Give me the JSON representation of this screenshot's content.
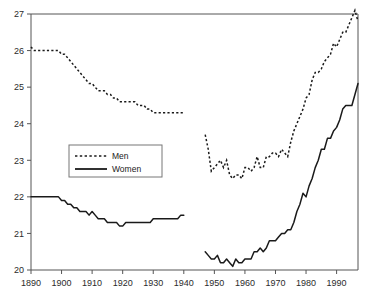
{
  "chart_data": {
    "type": "line",
    "title": "",
    "xlabel": "",
    "ylabel": "",
    "xlim": [
      1890,
      1997
    ],
    "ylim": [
      20,
      27
    ],
    "grid": false,
    "legend_position": "upper-left-inside",
    "xticks": [
      1890,
      1900,
      1910,
      1920,
      1930,
      1940,
      1950,
      1960,
      1970,
      1980,
      1990
    ],
    "yticks": [
      20,
      21,
      22,
      23,
      24,
      25,
      26,
      27
    ],
    "xtick_labels": [
      "1890",
      "1900",
      "1910",
      "1920",
      "1930",
      "1940",
      "1950",
      "1960",
      "1970",
      "1980",
      "1990"
    ],
    "ytick_labels": [
      "20",
      "21",
      "22",
      "23",
      "24",
      "25",
      "26",
      "27"
    ],
    "series": [
      {
        "name": "Men",
        "style": "dashed",
        "color": "#1a1a1a",
        "segments": [
          {
            "x": [
              1890,
              1891,
              1892,
              1893,
              1894,
              1895,
              1896,
              1897,
              1898,
              1899,
              1900,
              1901,
              1902,
              1903,
              1904,
              1905,
              1906,
              1907,
              1908,
              1909,
              1910,
              1911,
              1912,
              1913,
              1914,
              1915,
              1916,
              1917,
              1918,
              1919,
              1920,
              1921,
              1922,
              1923,
              1924,
              1925,
              1926,
              1927,
              1928,
              1929,
              1930,
              1931,
              1932,
              1933,
              1934,
              1935,
              1936,
              1937,
              1938,
              1939,
              1940
            ],
            "y": [
              26.1,
              26.0,
              26.0,
              26.0,
              26.0,
              26.0,
              26.0,
              26.0,
              26.0,
              26.0,
              25.9,
              25.9,
              25.8,
              25.7,
              25.6,
              25.5,
              25.4,
              25.3,
              25.2,
              25.1,
              25.1,
              25.0,
              24.9,
              24.9,
              24.9,
              24.8,
              24.8,
              24.7,
              24.7,
              24.6,
              24.6,
              24.6,
              24.6,
              24.6,
              24.6,
              24.5,
              24.5,
              24.5,
              24.4,
              24.4,
              24.3,
              24.3,
              24.3,
              24.3,
              24.3,
              24.3,
              24.3,
              24.3,
              24.3,
              24.3,
              24.3
            ]
          },
          {
            "x": [
              1947,
              1948,
              1949,
              1950,
              1951,
              1952,
              1953,
              1954,
              1955,
              1956,
              1957,
              1958,
              1959,
              1960,
              1961,
              1962,
              1963,
              1964,
              1965,
              1966,
              1967,
              1968,
              1969,
              1970,
              1971,
              1972,
              1973,
              1974,
              1975,
              1976,
              1977,
              1978,
              1979,
              1980,
              1981,
              1982,
              1983,
              1984,
              1985,
              1986,
              1987,
              1988,
              1989,
              1990,
              1991,
              1992,
              1993,
              1994,
              1995,
              1996,
              1997
            ],
            "y": [
              23.7,
              23.3,
              22.7,
              22.8,
              22.9,
              23.0,
              22.8,
              23.0,
              22.6,
              22.5,
              22.6,
              22.6,
              22.5,
              22.8,
              22.8,
              22.7,
              22.8,
              23.1,
              22.8,
              22.8,
              23.1,
              23.1,
              23.2,
              23.2,
              23.1,
              23.3,
              23.2,
              23.1,
              23.5,
              23.8,
              24.0,
              24.2,
              24.4,
              24.7,
              24.8,
              25.2,
              25.4,
              25.4,
              25.5,
              25.7,
              25.8,
              25.9,
              26.2,
              26.1,
              26.3,
              26.5,
              26.5,
              26.7,
              26.9,
              27.1,
              26.8
            ]
          }
        ]
      },
      {
        "name": "Women",
        "style": "solid",
        "color": "#1a1a1a",
        "segments": [
          {
            "x": [
              1890,
              1891,
              1892,
              1893,
              1894,
              1895,
              1896,
              1897,
              1898,
              1899,
              1900,
              1901,
              1902,
              1903,
              1904,
              1905,
              1906,
              1907,
              1908,
              1909,
              1910,
              1911,
              1912,
              1913,
              1914,
              1915,
              1916,
              1917,
              1918,
              1919,
              1920,
              1921,
              1922,
              1923,
              1924,
              1925,
              1926,
              1927,
              1928,
              1929,
              1930,
              1931,
              1932,
              1933,
              1934,
              1935,
              1936,
              1937,
              1938,
              1939,
              1940
            ],
            "y": [
              22.0,
              22.0,
              22.0,
              22.0,
              22.0,
              22.0,
              22.0,
              22.0,
              22.0,
              22.0,
              21.9,
              21.9,
              21.8,
              21.8,
              21.7,
              21.7,
              21.6,
              21.6,
              21.6,
              21.5,
              21.6,
              21.5,
              21.4,
              21.4,
              21.4,
              21.3,
              21.3,
              21.3,
              21.3,
              21.2,
              21.2,
              21.3,
              21.3,
              21.3,
              21.3,
              21.3,
              21.3,
              21.3,
              21.3,
              21.3,
              21.4,
              21.4,
              21.4,
              21.4,
              21.4,
              21.4,
              21.4,
              21.4,
              21.4,
              21.5,
              21.5
            ]
          },
          {
            "x": [
              1947,
              1948,
              1949,
              1950,
              1951,
              1952,
              1953,
              1954,
              1955,
              1956,
              1957,
              1958,
              1959,
              1960,
              1961,
              1962,
              1963,
              1964,
              1965,
              1966,
              1967,
              1968,
              1969,
              1970,
              1971,
              1972,
              1973,
              1974,
              1975,
              1976,
              1977,
              1978,
              1979,
              1980,
              1981,
              1982,
              1983,
              1984,
              1985,
              1986,
              1987,
              1988,
              1989,
              1990,
              1991,
              1992,
              1993,
              1994,
              1995,
              1996,
              1997
            ],
            "y": [
              20.5,
              20.4,
              20.3,
              20.3,
              20.4,
              20.2,
              20.2,
              20.3,
              20.2,
              20.1,
              20.3,
              20.2,
              20.2,
              20.3,
              20.3,
              20.3,
              20.5,
              20.5,
              20.6,
              20.5,
              20.6,
              20.8,
              20.8,
              20.8,
              20.9,
              21.0,
              21.0,
              21.1,
              21.1,
              21.3,
              21.6,
              21.8,
              22.1,
              22.0,
              22.3,
              22.5,
              22.8,
              23.0,
              23.3,
              23.3,
              23.6,
              23.6,
              23.8,
              23.9,
              24.1,
              24.4,
              24.5,
              24.5,
              24.5,
              24.8,
              25.1
            ]
          }
        ]
      }
    ],
    "legend": [
      {
        "label": "Men",
        "style": "dashed"
      },
      {
        "label": "Women",
        "style": "solid"
      }
    ]
  }
}
